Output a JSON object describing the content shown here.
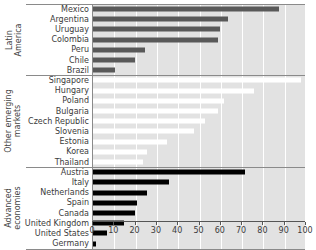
{
  "chart_data": {
    "type": "bar",
    "orientation": "horizontal",
    "title": "",
    "xlabel": "",
    "ylabel": "",
    "xlim": [
      0,
      100
    ],
    "xticks": [
      0,
      10,
      20,
      30,
      40,
      50,
      60,
      70,
      80,
      90,
      100
    ],
    "grid": true,
    "legend": "none",
    "groups": [
      {
        "name": "Latin\nAmerica",
        "bar_color": "#595959",
        "panel_color": "#e2e2e2",
        "categories": [
          "Mexico",
          "Argentina",
          "Uruguay",
          "Colombia",
          "Peru",
          "Chile",
          "Brazil"
        ],
        "values": [
          88,
          64,
          60,
          59,
          25,
          20,
          11
        ]
      },
      {
        "name": "Other emerging\nmarkets",
        "bar_color": "#ffffff",
        "panel_color": "#e2e2e2",
        "categories": [
          "Singapore",
          "Hungary",
          "Poland",
          "Bulgaria",
          "Czech Republic",
          "Slovenia",
          "Estonia",
          "Korea",
          "Thailand"
        ],
        "values": [
          98,
          76,
          62,
          59,
          53,
          48,
          35,
          26,
          24
        ]
      },
      {
        "name": "Advanced\neconomies",
        "bar_color": "#000000",
        "panel_color": "#e2e2e2",
        "categories": [
          "Austria",
          "Italy",
          "Netherlands",
          "Spain",
          "Canada",
          "United Kingdom",
          "United States",
          "Germany"
        ],
        "values": [
          72,
          36,
          26,
          21,
          20,
          15,
          7,
          2
        ]
      }
    ]
  }
}
